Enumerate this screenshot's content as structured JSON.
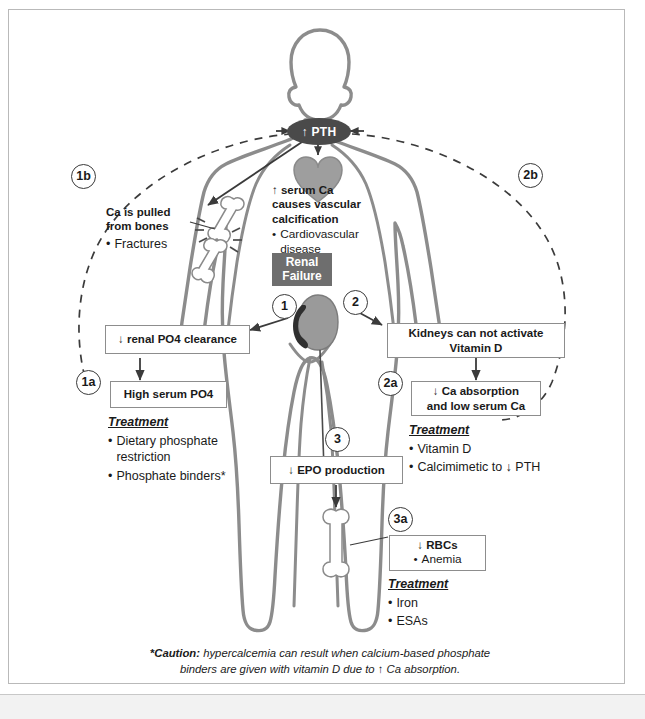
{
  "diagram": {
    "central_node": {
      "label": "↑ PTH"
    },
    "renal_failure_badge": {
      "line1": "Renal",
      "line2": "Failure"
    },
    "markers": {
      "m1": "1",
      "m1a": "1a",
      "m1b": "1b",
      "m2": "2",
      "m2a": "2a",
      "m2b": "2b",
      "m3": "3",
      "m3a": "3a"
    },
    "boxes": {
      "renal_po4_clearance": "↓ renal PO4 clearance",
      "high_serum_po4": "High serum PO4",
      "kidneys_vitamin_d_l1": "Kidneys can not activate",
      "kidneys_vitamin_d_l2": "Vitamin D",
      "ca_absorption_l1": "↓ Ca absorption",
      "ca_absorption_l2": "and low serum Ca",
      "epo_production": "↓ EPO production",
      "rbcs": "↓ RBCs",
      "rbcs_bullet": "Anemia"
    },
    "bone_block": {
      "heading_l1": "Ca is pulled",
      "heading_l2": "from bones",
      "bullet": "Fractures"
    },
    "heart_block": {
      "heading_l1": "↑ serum Ca",
      "heading_l2": "causes vascular",
      "heading_l3": "calcification",
      "bullet": "Cardiovascular disease"
    },
    "treatments": [
      {
        "id": "treatment-1a",
        "label": "Treatment",
        "items": [
          "Dietary phosphate restriction",
          "Phosphate binders*"
        ]
      },
      {
        "id": "treatment-2a",
        "label": "Treatment",
        "items": [
          "Vitamin D",
          "Calcimimetic to ↓ PTH"
        ]
      },
      {
        "id": "treatment-3a",
        "label": "Treatment",
        "items": [
          "Iron",
          "ESAs"
        ]
      }
    ],
    "caption": {
      "strong": "*Caution:",
      "rest_l1": "hypercalcemia can result when calcium-based phosphate",
      "rest_l2": "binders are given with vitamin D due to ↑ Ca absorption."
    },
    "colors": {
      "pth_fill": "#4a4a4a",
      "renal_failure_fill": "#6e6e6e",
      "body_outline": "#8c8c8c",
      "organ_fill": "#9a9a9a",
      "box_border": "#8d8d8d",
      "text": "#1a1a1a",
      "frame_border": "#b9b9b9"
    },
    "icons": [
      "heart-icon",
      "kidney-icon",
      "fractured-bone-icon",
      "bone-icon"
    ]
  }
}
